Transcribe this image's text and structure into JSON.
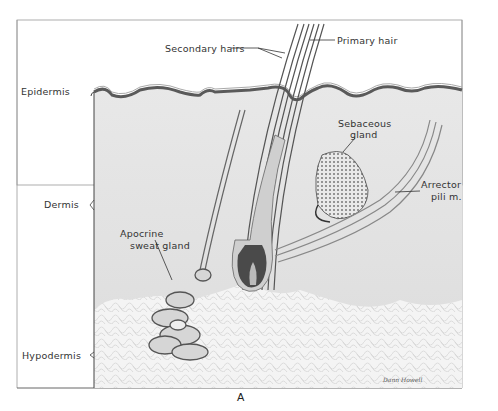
{
  "figure": {
    "caption": "A",
    "signature": "Dann Howell",
    "layer_labels": {
      "epidermis": "Epidermis",
      "dermis": "Dermis",
      "hypodermis": "Hypodermis"
    },
    "structure_labels": {
      "secondary_hairs": "Secondary hairs",
      "primary_hair": "Primary hair",
      "sebaceous_gland_line1": "Sebaceous",
      "sebaceous_gland_line2": "gland",
      "arrector_line1": "Arrector",
      "arrector_line2": "pili m.",
      "apocrine_line1": "Apocrine",
      "apocrine_line2": "sweat gland"
    },
    "colors": {
      "background": "#ffffff",
      "dermis_fill": "#e4e4e4",
      "hypodermis_fill": "#f3f3f3",
      "epidermis_stroke": "#5a5a5a",
      "follicle_dark": "#4a4a4a",
      "line": "#444444"
    }
  }
}
